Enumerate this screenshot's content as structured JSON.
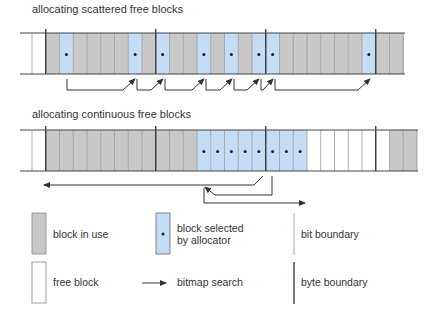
{
  "titles": {
    "scattered": "allocating scattered free blocks",
    "continuous": "allocating continuous free blocks"
  },
  "colors": {
    "in_use": "#c8c8c8",
    "selected": "#c5dcf5",
    "free": "#ffffff",
    "bit_boundary": "#9a9a9a",
    "byte_boundary": "#333333",
    "arrow": "#333333"
  },
  "scattered_row": {
    "cells": [
      "free",
      "in_use",
      "selected",
      "in_use",
      "in_use",
      "in_use",
      "in_use",
      "selected",
      "in_use",
      "selected",
      "in_use",
      "in_use",
      "selected",
      "in_use",
      "selected",
      "in_use",
      "selected",
      "selected",
      "in_use",
      "in_use",
      "in_use",
      "in_use",
      "in_use",
      "in_use",
      "selected",
      "in_use",
      "in_use"
    ],
    "byte_boundaries_after_cell": [
      0,
      8,
      16,
      24
    ]
  },
  "continuous_row": {
    "cells": [
      "free",
      "in_use",
      "in_use",
      "in_use",
      "in_use",
      "in_use",
      "in_use",
      "in_use",
      "in_use",
      "in_use",
      "in_use",
      "in_use",
      "selected",
      "selected",
      "selected",
      "selected",
      "selected",
      "selected",
      "selected",
      "selected",
      "free",
      "free",
      "free",
      "free",
      "free",
      "free",
      "in_use",
      "in_use"
    ],
    "byte_boundaries_after_cell": [
      0,
      8,
      16,
      24
    ]
  },
  "legend": {
    "in_use": "block in use",
    "selected_line1": "block selected",
    "selected_line2": "by allocator",
    "bit_boundary": "bit boundary",
    "free": "free block",
    "bitmap_search": "bitmap search",
    "byte_boundary": "byte boundary"
  }
}
